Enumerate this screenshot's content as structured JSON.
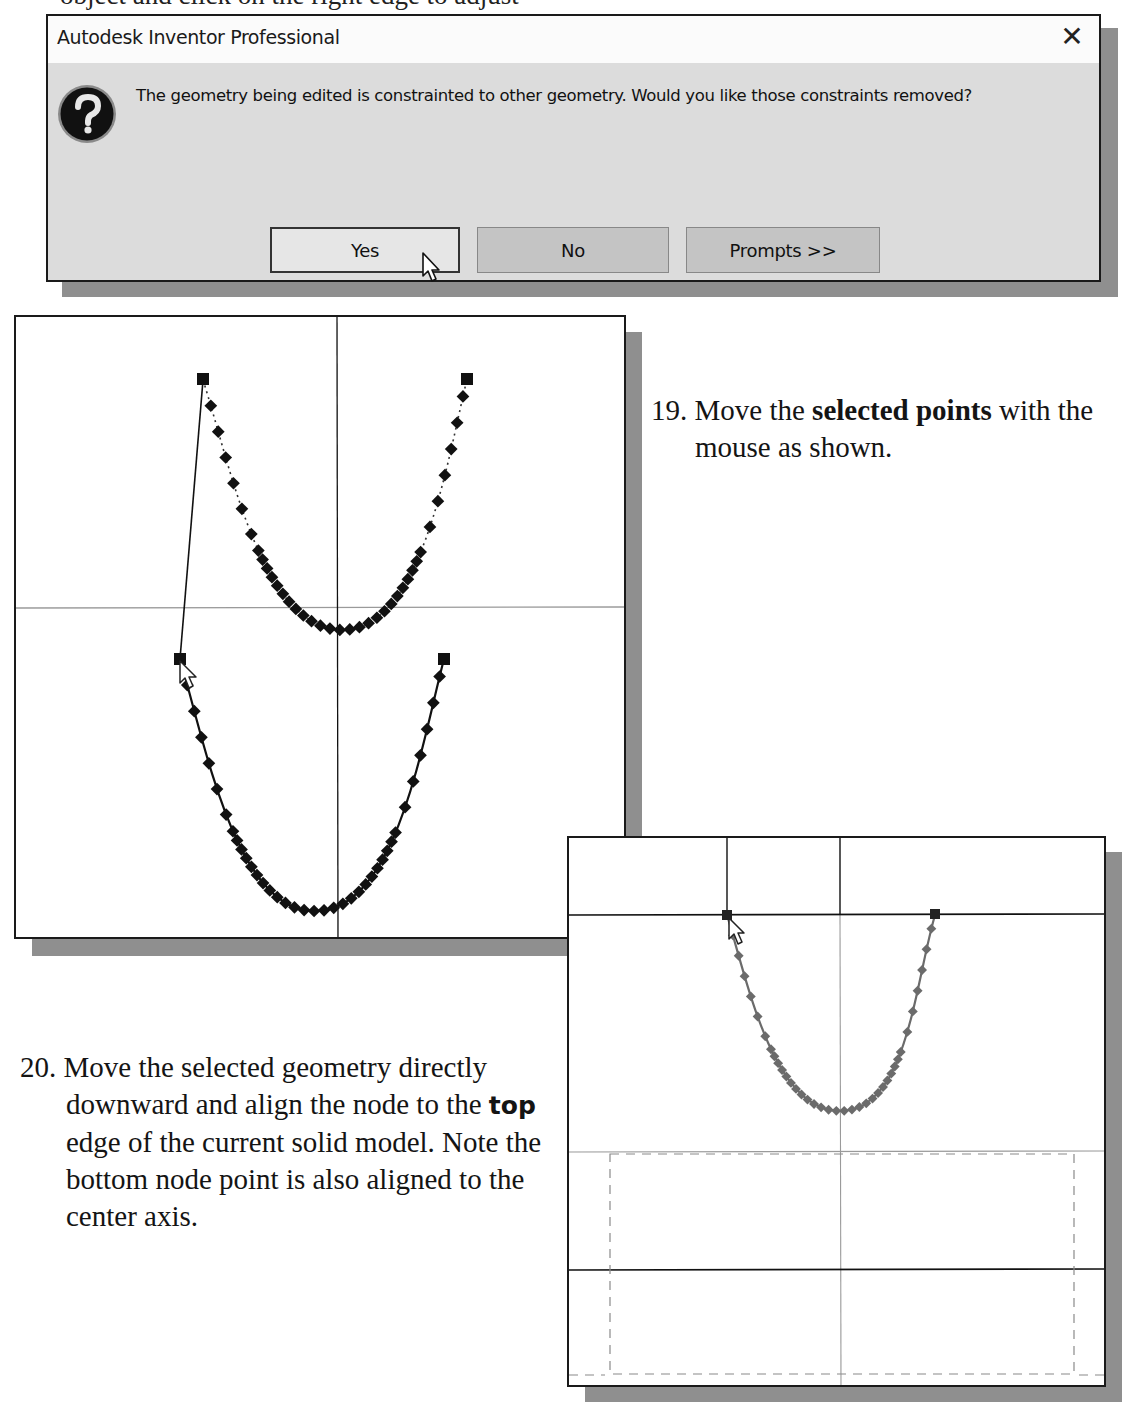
{
  "page": {
    "top_partial_text": "object and click on the right edge to adjust"
  },
  "dialog": {
    "title": "Autodesk Inventor Professional",
    "close_glyph": "✕",
    "icon": "question-icon",
    "message": "The geometry being edited is constrainted to other geometry. Would you like those constraints removed?",
    "buttons": [
      {
        "label": "Yes",
        "state": "focused"
      },
      {
        "label": "No",
        "state": "default"
      },
      {
        "label": "Prompts >>",
        "state": "default"
      }
    ],
    "colors": {
      "titlebar": "#fbfbfb",
      "body": "#dcdcdc",
      "button": "#c4c4c4",
      "border": "#1a1a1a"
    }
  },
  "steps": [
    {
      "number": "19.",
      "pre": "Move the ",
      "bold": "selected points",
      "post": " with the mouse as shown."
    },
    {
      "number": "20.",
      "line1": "Move the selected geometry directly downward and align the node to the ",
      "bold": "top",
      "post": " edge of the current solid model. Note the bottom node point is also aligned to the center axis."
    }
  ],
  "viewports": {
    "left": {
      "description": "Spline sketch being dragged: original curve (dotted, upper) and moved copy (solid, lower)",
      "curve_color": "#111111",
      "axis_color": "#111111",
      "horizontal_axis_color": "#9a9a9a"
    },
    "right": {
      "description": "Spline aligned to top edge of solid model; dashed hidden outline below",
      "curve_color": "#6b6b6b",
      "edge_color": "#111111",
      "center_axis_color": "#9a9a9a"
    }
  }
}
